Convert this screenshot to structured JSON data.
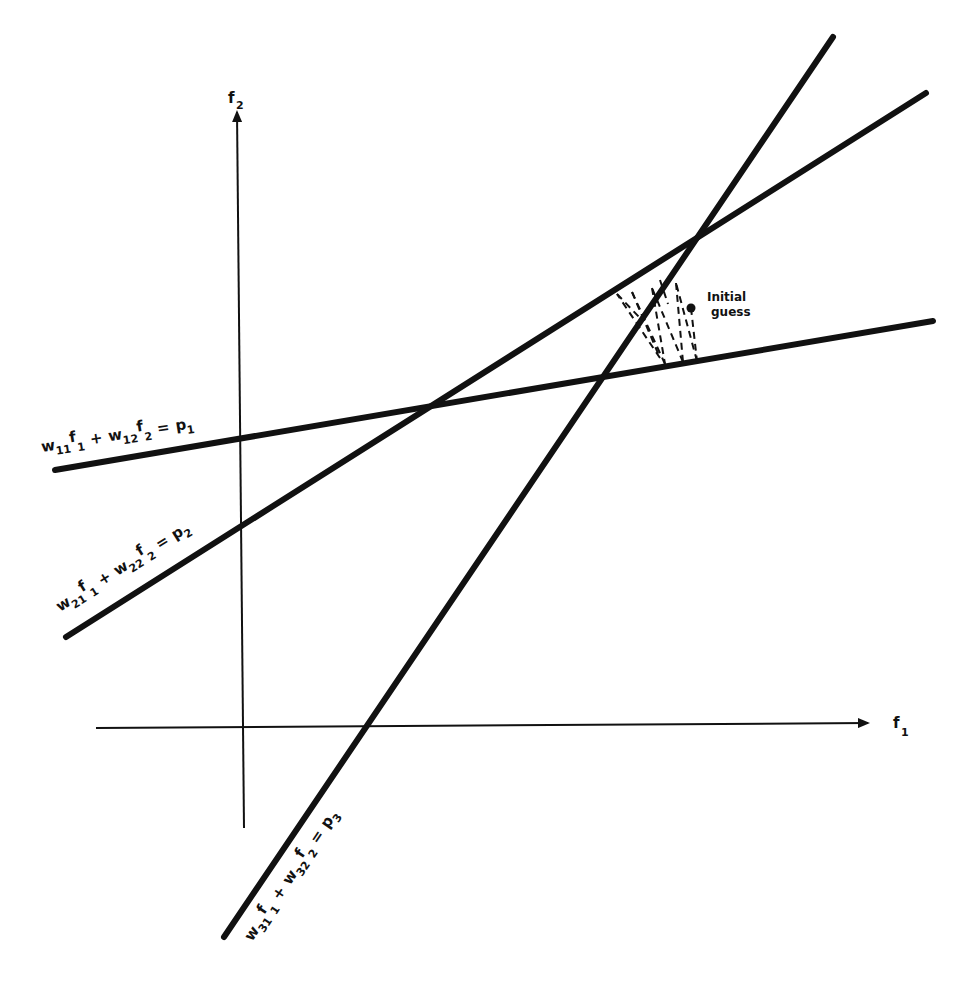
{
  "axes": {
    "x_label": "f",
    "x_sub": "1",
    "y_label": "f",
    "y_sub": "2"
  },
  "lines": [
    {
      "name": "line-1",
      "label_w1": "w",
      "label_w1_sub": "11",
      "label_f1": "f",
      "label_f1_sub": "1",
      "plus": "+",
      "label_w2": "w",
      "label_w2_sub": "12",
      "label_f2": "f",
      "label_f2_sub": "2",
      "eq": "=",
      "label_p": "p",
      "label_p_sub": "1"
    },
    {
      "name": "line-2",
      "label_w1": "w",
      "label_w1_sub": "21",
      "label_f1": "f",
      "label_f1_sub": "1",
      "plus": "+",
      "label_w2": "w",
      "label_w2_sub": "22",
      "label_f2": "f",
      "label_f2_sub": "2",
      "eq": "=",
      "label_p": "p",
      "label_p_sub": "2"
    },
    {
      "name": "line-3",
      "label_w1": "w",
      "label_w1_sub": "31",
      "label_f1": "f",
      "label_f1_sub": "1",
      "plus": "+",
      "label_w2": "w",
      "label_w2_sub": "32",
      "label_f2": "f",
      "label_f2_sub": "2",
      "eq": "=",
      "label_p": "p",
      "label_p_sub": "3"
    }
  ],
  "annotation": {
    "line1": "Initial",
    "line2": "guess"
  },
  "colors": {
    "ink": "#111111",
    "background": "#ffffff"
  }
}
